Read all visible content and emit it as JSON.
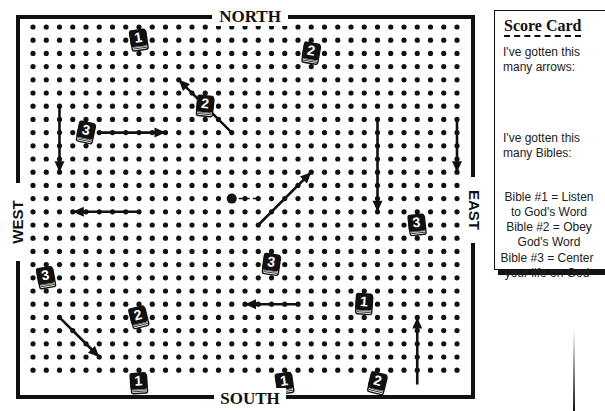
{
  "game": {
    "title": "Bible Maze Grid Game",
    "compass": {
      "north": "NORTH",
      "south": "SOUTH",
      "east": "EAST",
      "west": "WEST"
    },
    "grid": {
      "columns": 33,
      "rows": 27
    },
    "player": {
      "col": 15,
      "row": 13,
      "trail": "dashed-east"
    },
    "arrows": [
      {
        "name": "arrow-down-left",
        "from": [
          2,
          6
        ],
        "to": [
          2,
          11
        ],
        "direction": "down"
      },
      {
        "name": "arrow-right-top",
        "from": [
          5,
          8
        ],
        "to": [
          10,
          8
        ],
        "direction": "right"
      },
      {
        "name": "arrow-northwest-top",
        "from": [
          15,
          8
        ],
        "to": [
          11,
          4
        ],
        "direction": "northwest"
      },
      {
        "name": "arrow-down-center-right",
        "from": [
          26,
          7
        ],
        "to": [
          26,
          14
        ],
        "direction": "down"
      },
      {
        "name": "arrow-down-right",
        "from": [
          32,
          7
        ],
        "to": [
          32,
          11
        ],
        "direction": "down"
      },
      {
        "name": "arrow-northeast-center",
        "from": [
          17,
          15
        ],
        "to": [
          21,
          11
        ],
        "direction": "northeast"
      },
      {
        "name": "arrow-left-west",
        "from": [
          8,
          14
        ],
        "to": [
          3,
          14
        ],
        "direction": "left"
      },
      {
        "name": "arrow-left-south",
        "from": [
          20,
          21
        ],
        "to": [
          16,
          21
        ],
        "direction": "left"
      },
      {
        "name": "arrow-southeast-west",
        "from": [
          2,
          22
        ],
        "to": [
          5,
          25
        ],
        "direction": "southeast"
      },
      {
        "name": "arrow-up-east",
        "from": [
          29,
          27
        ],
        "to": [
          29,
          22
        ],
        "direction": "up"
      }
    ],
    "bibles": [
      {
        "number": "1",
        "col": 8,
        "row": 1
      },
      {
        "number": "2",
        "col": 21,
        "row": 2
      },
      {
        "number": "2",
        "col": 13,
        "row": 6
      },
      {
        "number": "3",
        "col": 4,
        "row": 8
      },
      {
        "number": "3",
        "col": 29,
        "row": 15
      },
      {
        "number": "3",
        "col": 18,
        "row": 18
      },
      {
        "number": "3",
        "col": 1,
        "row": 19
      },
      {
        "number": "1",
        "col": 25,
        "row": 21
      },
      {
        "number": "2",
        "col": 8,
        "row": 22
      },
      {
        "number": "1",
        "col": 8,
        "row": 27
      },
      {
        "number": "1",
        "col": 19,
        "row": 27
      },
      {
        "number": "2",
        "col": 26,
        "row": 27
      }
    ]
  },
  "scorecard": {
    "title": "Score Card",
    "arrows_label": "I've gotten this many arrows:",
    "arrows_line1": "I've gotten this",
    "arrows_line2": "many arrows:",
    "bibles_line1": "I've gotten this",
    "bibles_line2": "many Bibles:",
    "legend": [
      {
        "line1": "Bible #1 = Listen",
        "line2": "to God's Word"
      },
      {
        "line1": "Bible #2 = Obey",
        "line2": "God's Word"
      },
      {
        "line1": "Bible #3 = Center",
        "line2": "your life on God"
      }
    ]
  }
}
